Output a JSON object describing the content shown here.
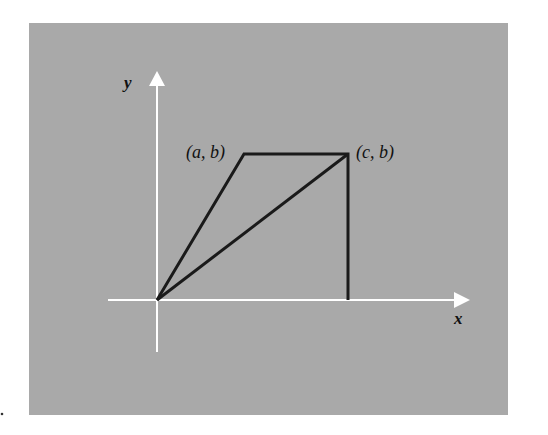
{
  "figure": {
    "background": "#a9a9a9",
    "axis_color": "#ffffff",
    "line_color": "#1a1a1a",
    "axes": {
      "x_label": "x",
      "y_label": "y"
    },
    "points": [
      {
        "name": "origin",
        "label": ""
      },
      {
        "name": "a-b",
        "label": "(a, b)"
      },
      {
        "name": "c-b",
        "label": "(c, b)"
      }
    ]
  }
}
